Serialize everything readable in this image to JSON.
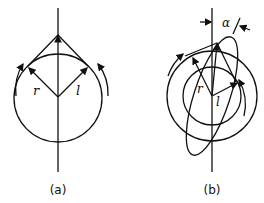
{
  "figure": {
    "panels": [
      {
        "id": "a",
        "caption": "(a)",
        "labels": {
          "right_vector": "r",
          "left_vector": "l"
        },
        "description": "Single circle with vertical axis; two vectors r and l from center meeting tangents at apex; circular rotation arrows on both sides"
      },
      {
        "id": "b",
        "caption": "(b)",
        "labels": {
          "right_vector": "r",
          "left_vector": "l",
          "angle": "α"
        },
        "description": "Two concentric circles with tilted ellipse; angle α between vertical axis and ellipse major axis; rotation arrows"
      }
    ]
  },
  "colors": {
    "stroke": "#111111",
    "background": "#ffffff"
  }
}
